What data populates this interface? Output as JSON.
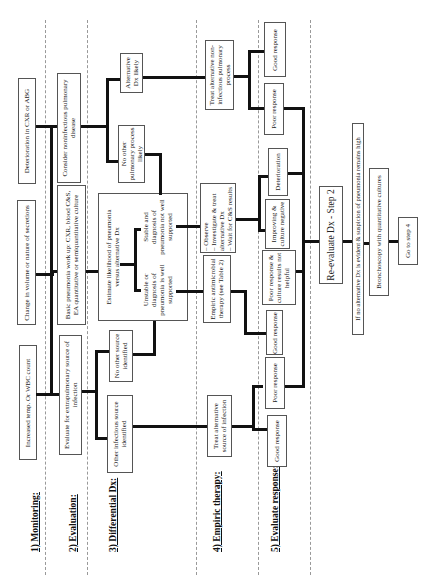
{
  "diagram": {
    "orientation": "rotated-90-ccw",
    "steps": [
      {
        "label": "1) Monitoring:"
      },
      {
        "label": "2) Evaluation:"
      },
      {
        "label": "3) Differential Dx:"
      },
      {
        "label": "4) Empiric   therapy:"
      },
      {
        "label": "5) Evaluate response:"
      }
    ],
    "nodes": {
      "mon_temp": "Increased temp. Or WBC count",
      "mon_secretions": "Change in volume or nature of secretions",
      "mon_deterioration": "Deterioration in CXR or ABG",
      "eval_extrapulm": "Evaluate for extrapulmonary source of infection",
      "eval_workup": "Basic pneumonia work up: CXR, blood C&S, EA quantitative or semiquantitative culture",
      "eval_noninfectious": "Consider noninfectious pulmonary disease",
      "dx_other_infectious": "Other infectious source identified",
      "dx_no_other_source": "No other source identified",
      "dx_estimate": "Estimate likelihood of pneumonia versus alternative Dx",
      "dx_unstable": "Unstable or diagnosis of pneumonia is well supported",
      "dx_stable": "Stable and diagnosis of pneumonia not well supported",
      "dx_no_other_pulm": "No other pulmonary process likely",
      "dx_alt_likely": "Alternative Dx likely",
      "tx_alt_infection": "Treat alternative source of infection",
      "tx_empiric": "Empiric antimicrobial therapy (see Table 2)",
      "tx_observe": "– Observe\n– Investigate & treat alternative Dx\n– Wait for C&S results",
      "tx_alt_noninfectious": "Treat alternative non-infectious pulmonary process",
      "resp_good_1": "Good response",
      "resp_poor_1": "Poor response",
      "resp_good_2": "Good response",
      "resp_poor_cultures": "Poor response & culture results not helpful",
      "resp_improving": "Improving & culture negative",
      "resp_deterioration": "Deterioration",
      "resp_poor_2": "Poor response",
      "resp_good_3": "Good response",
      "reevaluate": "Re-evaluate Dx - Step 2",
      "if_no_alt": "If no alternative Dx is evident & suspicion of pneumonia remains high",
      "bronchoscopy": "Bronchoscopy with quantitative cultures",
      "go_step4": "Go to step 4"
    }
  }
}
